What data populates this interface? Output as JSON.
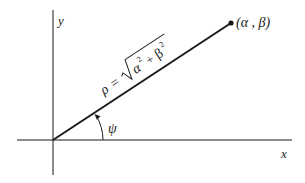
{
  "diagram": {
    "axes": {
      "x_label": "x",
      "y_label": "y"
    },
    "point": {
      "label": "(α , β)"
    },
    "segment": {
      "rho_symbol": "ρ",
      "equals": "=",
      "radicand": "α² + β²",
      "radicand_alpha": "α",
      "radicand_plus": "+",
      "radicand_beta": "β",
      "exponent": "2"
    },
    "angle": {
      "label": "ψ"
    },
    "colors": {
      "line": "#1a1a1a",
      "background": "#ffffff"
    }
  }
}
